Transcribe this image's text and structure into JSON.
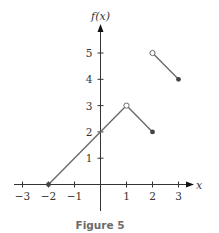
{
  "chart_data": {
    "type": "line",
    "title": "",
    "xlabel": "x",
    "ylabel": "f(x)",
    "xlim": [
      -3.3,
      3.6
    ],
    "ylim": [
      -1.0,
      5.8
    ],
    "grid": false,
    "legend": null,
    "x_ticks": [
      -3,
      -2,
      -1,
      1,
      2,
      3
    ],
    "y_ticks": [
      1,
      2,
      3,
      4,
      5
    ],
    "x_tick_labels": [
      "−3",
      "−2",
      "−1",
      "1",
      "2",
      "3"
    ],
    "y_tick_labels": [
      "1",
      "2",
      "3",
      "4",
      "5"
    ],
    "series": [
      {
        "name": "segment 1",
        "points": [
          [
            -2,
            0
          ],
          [
            1,
            3
          ]
        ],
        "endpoints": [
          {
            "x": -2,
            "y": 0,
            "style": "closed"
          },
          {
            "x": 1,
            "y": 3,
            "style": "open"
          }
        ]
      },
      {
        "name": "segment 2",
        "points": [
          [
            1,
            3
          ],
          [
            2,
            2
          ]
        ],
        "endpoints": [
          {
            "x": 2,
            "y": 2,
            "style": "closed"
          }
        ]
      },
      {
        "name": "segment 3",
        "points": [
          [
            2,
            5
          ],
          [
            3,
            4
          ]
        ],
        "endpoints": [
          {
            "x": 2,
            "y": 5,
            "style": "open"
          },
          {
            "x": 3,
            "y": 4,
            "style": "closed"
          }
        ]
      }
    ]
  },
  "labels": {
    "x_axis": "x",
    "y_axis": "f(x)",
    "caption": "Figure 5"
  },
  "colors": {
    "axis": "#333333",
    "line": "#6a6a6a",
    "caption": "#6b6b6b"
  }
}
